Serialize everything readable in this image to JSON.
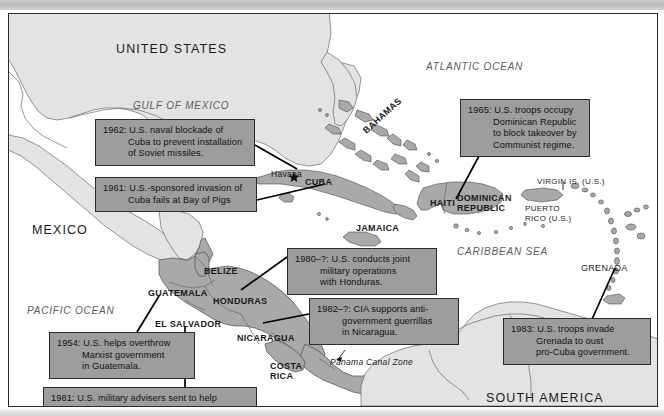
{
  "map": {
    "title_region": "Caribbean and Central America — U.S. interventions",
    "colors": {
      "land_light": "#e3e3e3",
      "land_dark": "#a9a9a9",
      "ocean": "#ffffff",
      "callout_fill": "#9d9d9d",
      "border": "#2b2b2b",
      "ocean_label": "#5c5c5c"
    },
    "ocean_labels": [
      {
        "name": "gulf-of-mexico",
        "text": "GULF OF MEXICO",
        "x": 124,
        "y": 86
      },
      {
        "name": "atlantic-ocean",
        "text": "ATLANTIC OCEAN",
        "x": 417,
        "y": 47
      },
      {
        "name": "caribbean-sea",
        "text": "CARIBBEAN SEA",
        "x": 448,
        "y": 232
      },
      {
        "name": "pacific-ocean",
        "text": "PACIFIC OCEAN",
        "x": 18,
        "y": 291
      }
    ],
    "region_labels": [
      {
        "name": "united-states",
        "text": "UNITED STATES",
        "x": 107,
        "y": 28
      },
      {
        "name": "mexico",
        "text": "MEXICO",
        "x": 23,
        "y": 209
      },
      {
        "name": "south-america",
        "text": "SOUTH AMERICA",
        "x": 477,
        "y": 377
      }
    ],
    "country_labels": [
      {
        "name": "cuba",
        "text": "CUBA",
        "x": 296,
        "y": 163
      },
      {
        "name": "jamaica",
        "text": "JAMAICA",
        "x": 347,
        "y": 209
      },
      {
        "name": "haiti",
        "text": "HAITI",
        "x": 421,
        "y": 184
      },
      {
        "name": "dominican-republic",
        "text": "DOMINICAN REPUBLIC",
        "x": 448,
        "y": 180
      },
      {
        "name": "puerto-rico",
        "text": "PUERTO RICO (U.S.)",
        "x": 516,
        "y": 190
      },
      {
        "name": "virgin-islands",
        "text": "VIRGIN IS. (U.S.)",
        "x": 528,
        "y": 163
      },
      {
        "name": "grenada",
        "text": "GRENADA",
        "x": 572,
        "y": 249
      },
      {
        "name": "bahamas",
        "text": "BAHAMAS",
        "x": 352,
        "y": 114
      },
      {
        "name": "belize",
        "text": "BELIZE",
        "x": 195,
        "y": 252
      },
      {
        "name": "guatemala",
        "text": "GUATEMALA",
        "x": 139,
        "y": 274
      },
      {
        "name": "honduras",
        "text": "HONDURAS",
        "x": 204,
        "y": 282
      },
      {
        "name": "el-salvador",
        "text": "EL SALVADOR",
        "x": 146,
        "y": 305
      },
      {
        "name": "nicaragua",
        "text": "NICARAGUA",
        "x": 228,
        "y": 319
      },
      {
        "name": "costa-rica",
        "text": "COSTA RICA",
        "x": 261,
        "y": 348
      },
      {
        "name": "panama",
        "text": "PANAMA",
        "x": 337,
        "y": 395
      },
      {
        "name": "havana",
        "text": "Havana",
        "x": 262,
        "y": 155
      },
      {
        "name": "panama-canal-zone",
        "text": "Panama Canal Zone",
        "x": 321,
        "y": 343
      }
    ],
    "callouts": [
      {
        "name": "callout-1962-cuba-blockade",
        "year": "1962",
        "lines": [
          "1962: U.S. naval blockade of",
          "Cuba to prevent installation",
          "of Soviet missiles."
        ],
        "x": 86,
        "y": 105,
        "width": 160,
        "height": 46
      },
      {
        "name": "callout-1961-bay-of-pigs",
        "year": "1961",
        "lines": [
          "1961: U.S.-sponsored invasion of",
          "Cuba fails at Bay of Pigs"
        ],
        "x": 86,
        "y": 163,
        "width": 162,
        "height": 34
      },
      {
        "name": "callout-1965-dominican-republic",
        "year": "1965",
        "lines": [
          "1965: U.S. troops occupy",
          "Dominican Republic",
          "to block takeover by",
          "Communist regime."
        ],
        "x": 451,
        "y": 85,
        "width": 130,
        "height": 57
      },
      {
        "name": "callout-1980-honduras",
        "year": "1980–?",
        "lines": [
          "1980–?: U.S. conducts joint",
          "military operations",
          "with Honduras."
        ],
        "x": 278,
        "y": 234,
        "width": 150,
        "height": 44
      },
      {
        "name": "callout-1982-nicaragua",
        "year": "1982–?",
        "lines": [
          "1982–?: CIA supports anti-",
          "government guerrillas",
          "in Nicaragua."
        ],
        "x": 300,
        "y": 284,
        "width": 150,
        "height": 44
      },
      {
        "name": "callout-1983-grenada",
        "year": "1983",
        "lines": [
          "1983: U.S. troops invade",
          "Grenada to oust",
          "pro-Cuba government."
        ],
        "x": 494,
        "y": 304,
        "width": 148,
        "height": 44
      },
      {
        "name": "callout-1954-guatemala",
        "year": "1954",
        "lines": [
          "1954: U.S. helps overthrow",
          "Marxist government",
          "in Guatemala."
        ],
        "x": 40,
        "y": 318,
        "width": 146,
        "height": 44
      },
      {
        "name": "callout-1981-el-salvador",
        "year": "1981",
        "lines": [
          "1981: U.S. military advisers sent to help",
          "government of El Salvador."
        ],
        "x": 34,
        "y": 373,
        "width": 214,
        "height": 33
      }
    ],
    "leader_lines": [
      {
        "name": "leader-1962",
        "x1": 246,
        "y1": 131,
        "x2": 288,
        "y2": 155
      },
      {
        "name": "leader-1961",
        "x1": 248,
        "y1": 186,
        "x2": 316,
        "y2": 170
      },
      {
        "name": "leader-1965",
        "x1": 470,
        "y1": 142,
        "x2": 447,
        "y2": 185
      },
      {
        "name": "leader-1980",
        "x1": 278,
        "y1": 243,
        "x2": 232,
        "y2": 276
      },
      {
        "name": "leader-1982",
        "x1": 300,
        "y1": 300,
        "x2": 254,
        "y2": 309
      },
      {
        "name": "leader-1983",
        "x1": 580,
        "y1": 312,
        "x2": 606,
        "y2": 254
      },
      {
        "name": "leader-1954",
        "x1": 128,
        "y1": 318,
        "x2": 150,
        "y2": 282
      },
      {
        "name": "leader-1981",
        "x1": 176,
        "y1": 373,
        "x2": 176,
        "y2": 312
      }
    ]
  }
}
